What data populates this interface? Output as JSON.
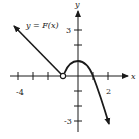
{
  "graph": {
    "function_label": "y = F(x)",
    "x_axis_label": "x",
    "y_axis_label": "y",
    "x_tick_labels": [
      {
        "value": -4,
        "text": "-4"
      },
      {
        "value": 2,
        "text": "2"
      }
    ],
    "y_tick_labels": [
      {
        "value": 3,
        "text": "3"
      },
      {
        "value": -3,
        "text": "-3"
      }
    ],
    "x_ticks": [
      -4,
      -3,
      -2,
      -1,
      0,
      1,
      2
    ],
    "y_ticks": [
      -3,
      -2,
      -1,
      0,
      1,
      2,
      3
    ],
    "open_circle_point": {
      "x": -1,
      "y": 0
    },
    "pieces": [
      {
        "type": "line",
        "from": {
          "x": -1,
          "y": 0
        },
        "to": {
          "x": -4.3,
          "y": 3.3
        },
        "arrow": "end",
        "endpoint_open": true
      },
      {
        "type": "curve",
        "points": [
          {
            "x": -1,
            "y": 0
          },
          {
            "x": 0,
            "y": 1
          },
          {
            "x": 1,
            "y": 0
          },
          {
            "x": 2.1,
            "y": -3.3
          }
        ],
        "arrow": "end"
      }
    ],
    "colors": {
      "ink": "#1a1a1a",
      "background": "#ffffff"
    }
  }
}
